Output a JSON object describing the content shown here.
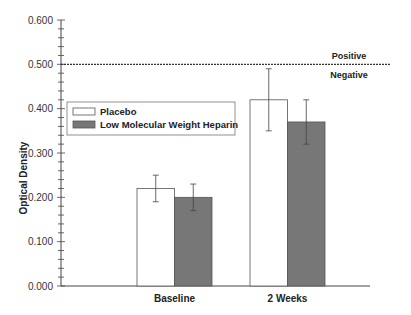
{
  "chart_data": {
    "type": "bar",
    "title": "",
    "xlabel": "",
    "ylabel": "Optical Density",
    "ylim": [
      0,
      0.6
    ],
    "yticks": [
      "0.000",
      "0.100",
      "0.200",
      "0.300",
      "0.400",
      "0.500",
      "0.600"
    ],
    "categories": [
      "Baseline",
      "2 Weeks"
    ],
    "series": [
      {
        "name": "Placebo",
        "color": "#ffffff",
        "values": [
          0.22,
          0.42
        ],
        "error_low": [
          0.19,
          0.35
        ],
        "error_high": [
          0.25,
          0.49
        ]
      },
      {
        "name": "Low Molecular Weight Heparin",
        "color": "#777777",
        "values": [
          0.2,
          0.37
        ],
        "error_low": [
          0.17,
          0.32
        ],
        "error_high": [
          0.23,
          0.42
        ]
      }
    ],
    "reference_line": {
      "value": 0.5,
      "style": "dashed",
      "label_above": "Positive",
      "label_below": "Negative"
    },
    "legend_position": "upper-left",
    "grid": false
  }
}
